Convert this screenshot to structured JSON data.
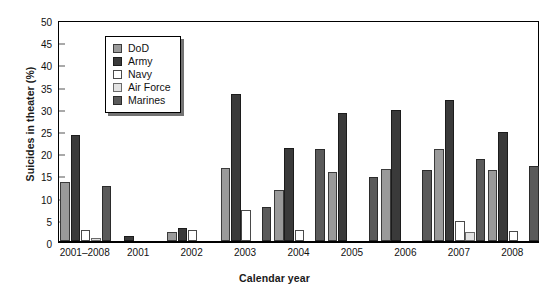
{
  "chart_data": {
    "type": "bar",
    "title": "",
    "xlabel": "Calendar year",
    "ylabel": "Suicides in theater (%)",
    "ylim": [
      0,
      50
    ],
    "ytick_step": 5,
    "yticks": [
      0,
      5,
      10,
      15,
      20,
      25,
      30,
      35,
      40,
      45,
      50
    ],
    "grid": false,
    "legend_position": "upper-left-inside",
    "categories": [
      "2001–2008",
      "2001",
      "2002",
      "2003",
      "2004",
      "2005",
      "2006",
      "2007",
      "2008"
    ],
    "series": [
      {
        "name": "DoD",
        "color": "#9a9a9a",
        "values": [
          13.2,
          0,
          2.0,
          16.5,
          11.5,
          15.5,
          16.2,
          20.8,
          15.9
        ]
      },
      {
        "name": "Army",
        "color": "#3a3a3a",
        "values": [
          23.8,
          1.2,
          3.0,
          33.0,
          21.0,
          28.8,
          29.5,
          31.8,
          24.6
        ]
      },
      {
        "name": "Navy",
        "color": "#ffffff",
        "values": [
          2.4,
          0,
          2.5,
          7.0,
          2.4,
          0,
          0,
          4.6,
          2.3
        ]
      },
      {
        "name": "Air Force",
        "color": "#e3e3e3",
        "values": [
          0.6,
          0,
          0,
          0,
          0,
          0,
          0,
          2.0,
          0
        ]
      },
      {
        "name": "Marines",
        "color": "#5a5a5a",
        "values": [
          12.5,
          0,
          0,
          7.6,
          20.7,
          14.5,
          16.1,
          18.5,
          17.0
        ]
      }
    ]
  },
  "legend": {
    "items": [
      {
        "label": "DoD"
      },
      {
        "label": "Army"
      },
      {
        "label": "Navy"
      },
      {
        "label": "Air Force"
      },
      {
        "label": "Marines"
      }
    ]
  }
}
